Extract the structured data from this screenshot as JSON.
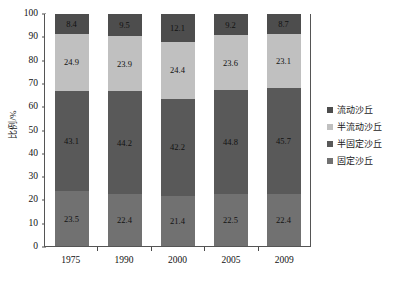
{
  "chart_data": {
    "type": "bar",
    "stacked": true,
    "title": "",
    "xlabel": "",
    "ylabel": "比例/%",
    "ylim": [
      0,
      100
    ],
    "yticks": [
      0,
      10,
      20,
      30,
      40,
      50,
      60,
      70,
      80,
      90,
      100
    ],
    "ytick_labels": [
      "0",
      "10",
      "20",
      "30",
      "40",
      "50",
      "60",
      "70",
      "80",
      "90",
      "100"
    ],
    "grid": false,
    "legend_position": "right",
    "categories": [
      "1975",
      "1990",
      "2000",
      "2005",
      "2009"
    ],
    "series": [
      {
        "name": "流动沙丘",
        "color": "#4d4d4d",
        "values": [
          8.4,
          9.5,
          12.1,
          9.2,
          8.7
        ],
        "labels": [
          "8.4",
          "9.5",
          "12.1",
          "9.2",
          "8.7"
        ]
      },
      {
        "name": "半流动沙丘",
        "color": "#c0c0c0",
        "values": [
          24.9,
          23.9,
          24.4,
          23.6,
          23.1
        ],
        "labels": [
          "24.9",
          "23.9",
          "24.4",
          "23.6",
          "23.1"
        ]
      },
      {
        "name": "半固定沙丘",
        "color": "#595959",
        "values": [
          43.1,
          44.2,
          42.2,
          44.8,
          45.7
        ],
        "labels": [
          "43.1",
          "44.2",
          "42.2",
          "44.8",
          "45.7"
        ]
      },
      {
        "name": "固定沙丘",
        "color": "#717171",
        "values": [
          23.5,
          22.4,
          21.4,
          22.5,
          22.4
        ],
        "labels": [
          "23.5",
          "22.4",
          "21.4",
          "22.5",
          "22.4"
        ]
      }
    ],
    "legend_entries": [
      {
        "label": "流动沙丘",
        "color": "#4d4d4d"
      },
      {
        "label": "半流动沙丘",
        "color": "#c0c0c0"
      },
      {
        "label": "半固定沙丘",
        "color": "#595959"
      },
      {
        "label": "固定沙丘",
        "color": "#717171"
      }
    ]
  }
}
